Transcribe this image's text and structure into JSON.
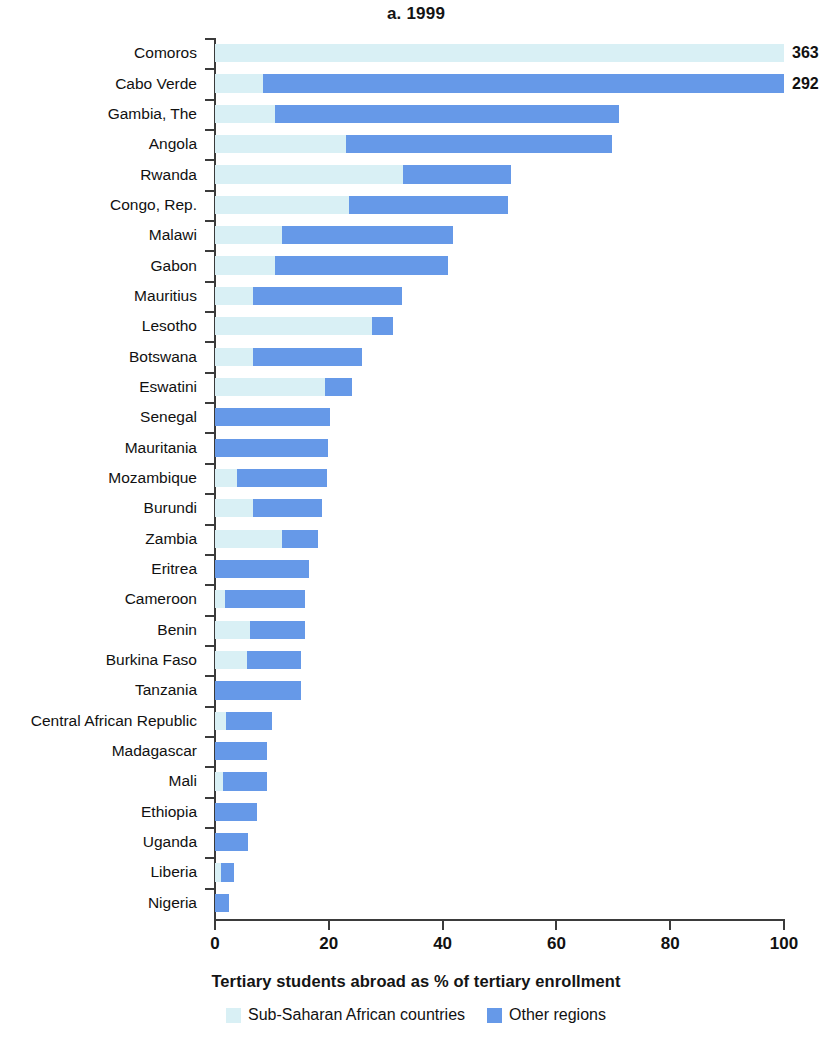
{
  "chart_data": {
    "type": "bar",
    "orientation": "horizontal",
    "stacked": true,
    "title": "a. 1999",
    "xlabel": "Tertiary students abroad as % of tertiary enrollment",
    "ylabel": "",
    "xlim": [
      0,
      100
    ],
    "xticks": [
      0,
      20,
      40,
      60,
      80,
      100
    ],
    "xticklabels": [
      "0",
      "20",
      "40",
      "60",
      "80",
      "100"
    ],
    "grid": false,
    "legend_position": "bottom",
    "legend": [
      {
        "name": "Sub-Saharan African countries",
        "color": "#d9f0f5"
      },
      {
        "name": "Other regions",
        "color": "#6699e8"
      }
    ],
    "series": [
      {
        "name": "Sub-Saharan African countries",
        "color": "#d9f0f5",
        "values": [
          100.0,
          8.5,
          10.6,
          23.0,
          33.0,
          23.5,
          11.8,
          10.5,
          6.7,
          27.6,
          6.7,
          19.3,
          0.0,
          0.0,
          3.9,
          6.7,
          11.8,
          0.0,
          1.8,
          6.2,
          5.6,
          0.0,
          1.9,
          0.0,
          1.4,
          0.0,
          0.0,
          1.0,
          0.0
        ]
      },
      {
        "name": "Other regions",
        "color": "#6699e8",
        "values": [
          0.0,
          91.5,
          60.4,
          46.8,
          19.0,
          28.0,
          30.0,
          30.5,
          26.1,
          3.7,
          19.1,
          4.7,
          20.2,
          19.8,
          15.8,
          12.1,
          6.3,
          16.5,
          14.0,
          9.6,
          9.5,
          15.1,
          8.1,
          9.1,
          7.7,
          7.4,
          5.8,
          2.3,
          2.5
        ]
      }
    ],
    "categories": [
      "Comoros",
      "Cabo Verde",
      "Gambia, The",
      "Angola",
      "Rwanda",
      "Congo, Rep.",
      "Malawi",
      "Gabon",
      "Mauritius",
      "Lesotho",
      "Botswana",
      "Eswatini",
      "Senegal",
      "Mauritania",
      "Mozambique",
      "Burundi",
      "Zambia",
      "Eritrea",
      "Cameroon",
      "Benin",
      "Burkina Faso",
      "Tanzania",
      "Central African Republic",
      "Madagascar",
      "Mali",
      "Ethiopia",
      "Uganda",
      "Liberia",
      "Nigeria"
    ],
    "totals": [
      363,
      292,
      71.0,
      69.8,
      52.0,
      51.5,
      41.8,
      41.0,
      32.8,
      31.3,
      25.8,
      24.0,
      20.2,
      19.8,
      19.7,
      18.8,
      18.1,
      16.5,
      15.8,
      15.8,
      15.1,
      15.1,
      10.0,
      9.1,
      9.1,
      7.4,
      5.8,
      3.3,
      2.5
    ],
    "value_labels": [
      {
        "category": "Comoros",
        "text": "363"
      },
      {
        "category": "Cabo Verde",
        "text": "292"
      }
    ]
  },
  "colors": {
    "ssa": "#d9f0f5",
    "other": "#6699e8",
    "axis": "#3b3b3b",
    "text": "#111111",
    "background": "#ffffff"
  }
}
